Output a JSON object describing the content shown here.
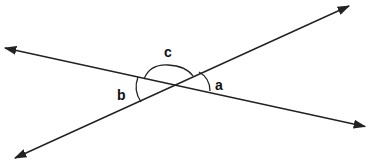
{
  "diagram": {
    "type": "intersecting-lines-angles",
    "colors": {
      "line": "#222222",
      "background": "#ffffff"
    },
    "lines": [
      {
        "name": "line-1",
        "from": [
          2,
          47
        ],
        "to": [
          368,
          127
        ],
        "arrows": "both"
      },
      {
        "name": "line-2",
        "from": [
          12,
          160
        ],
        "to": [
          352,
          4
        ],
        "arrows": "both"
      }
    ],
    "intersection": [
      172,
      85
    ],
    "angles": [
      {
        "label": "a",
        "position": "right"
      },
      {
        "label": "b",
        "position": "left"
      },
      {
        "label": "c",
        "position": "top"
      }
    ]
  }
}
